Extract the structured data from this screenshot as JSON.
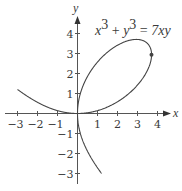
{
  "chart_data": {
    "type": "line",
    "title": "",
    "annotation": "x³ + y³ = 7xy",
    "equation": {
      "lhs_terms": [
        "x",
        "3",
        "y",
        "3"
      ],
      "rhs": "7xy",
      "a_param": 7
    },
    "xlabel": "x",
    "ylabel": "y",
    "xlim": [
      -3.5,
      4.6
    ],
    "ylim": [
      -3.5,
      4.7
    ],
    "grid": false,
    "x_ticks": [
      -3,
      -2,
      -1,
      1,
      2,
      3,
      4
    ],
    "x_tick_labels": [
      "−3",
      "−2",
      "−1",
      "1",
      "2",
      "3",
      "4"
    ],
    "y_ticks": [
      4,
      3,
      2,
      1,
      -1,
      -2,
      -3
    ],
    "y_tick_labels": [
      "4",
      "3",
      "2",
      "1",
      "−1",
      "−2",
      "−3"
    ],
    "series": [
      {
        "name": "Folium of Descartes x³ + y³ = 7xy",
        "color": "#444444",
        "branches": {
          "loop": [
            [
              0,
              0
            ],
            [
              0.7,
              2.3
            ],
            [
              1.5,
              3.2
            ],
            [
              2.33,
              3.7
            ],
            [
              3.0,
              3.7
            ],
            [
              3.7,
              2.94
            ],
            [
              3.5,
              2.0
            ],
            [
              2.33,
              0.78
            ],
            [
              1.0,
              0.15
            ],
            [
              0,
              0
            ]
          ],
          "upper_left": [
            [
              -3.0,
              1.2
            ],
            [
              -2.0,
              0.55
            ],
            [
              -1.0,
              0.14
            ],
            [
              0,
              0
            ]
          ],
          "lower_right": [
            [
              0,
              0
            ],
            [
              0.14,
              -1.0
            ],
            [
              0.55,
              -2.0
            ],
            [
              1.2,
              -3.0
            ]
          ]
        }
      }
    ],
    "highlight_point": {
      "x": 3.7,
      "y": 2.94,
      "note": "vertical tangent point"
    }
  },
  "axes": {
    "x_label": "x",
    "y_label": "y"
  },
  "style": {
    "curve_color": "#444444",
    "axis_color": "#555555",
    "text_color": "#3a3a3a"
  }
}
